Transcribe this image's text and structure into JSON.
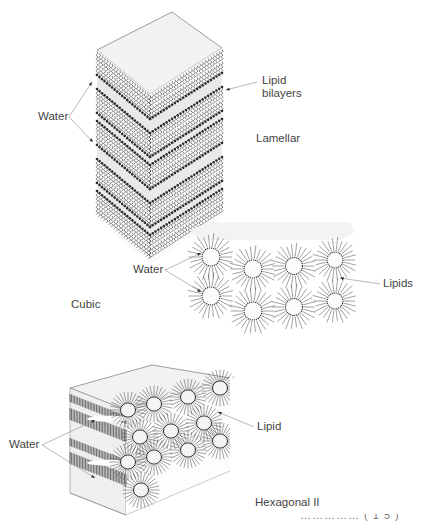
{
  "figure": {
    "panels": [
      {
        "id": "lamellar",
        "title": "Lamellar",
        "labels": {
          "water": "Water",
          "bilayers": "Lipid\nbilayers"
        }
      },
      {
        "id": "cubic",
        "title": "Cubic",
        "labels": {
          "water": "Water",
          "lipids": "Lipids"
        }
      },
      {
        "id": "hexagonal",
        "title": "Hexagonal II",
        "labels": {
          "water": "Water",
          "lipid": "Lipid"
        }
      }
    ],
    "caption_fragment": "…………… ( 1 5 )"
  },
  "colors": {
    "ink": "#2b2b2b",
    "shade": "#e9e9e9",
    "light": "#f2f2f2",
    "text": "#444444",
    "leader": "#9a9a9a"
  }
}
